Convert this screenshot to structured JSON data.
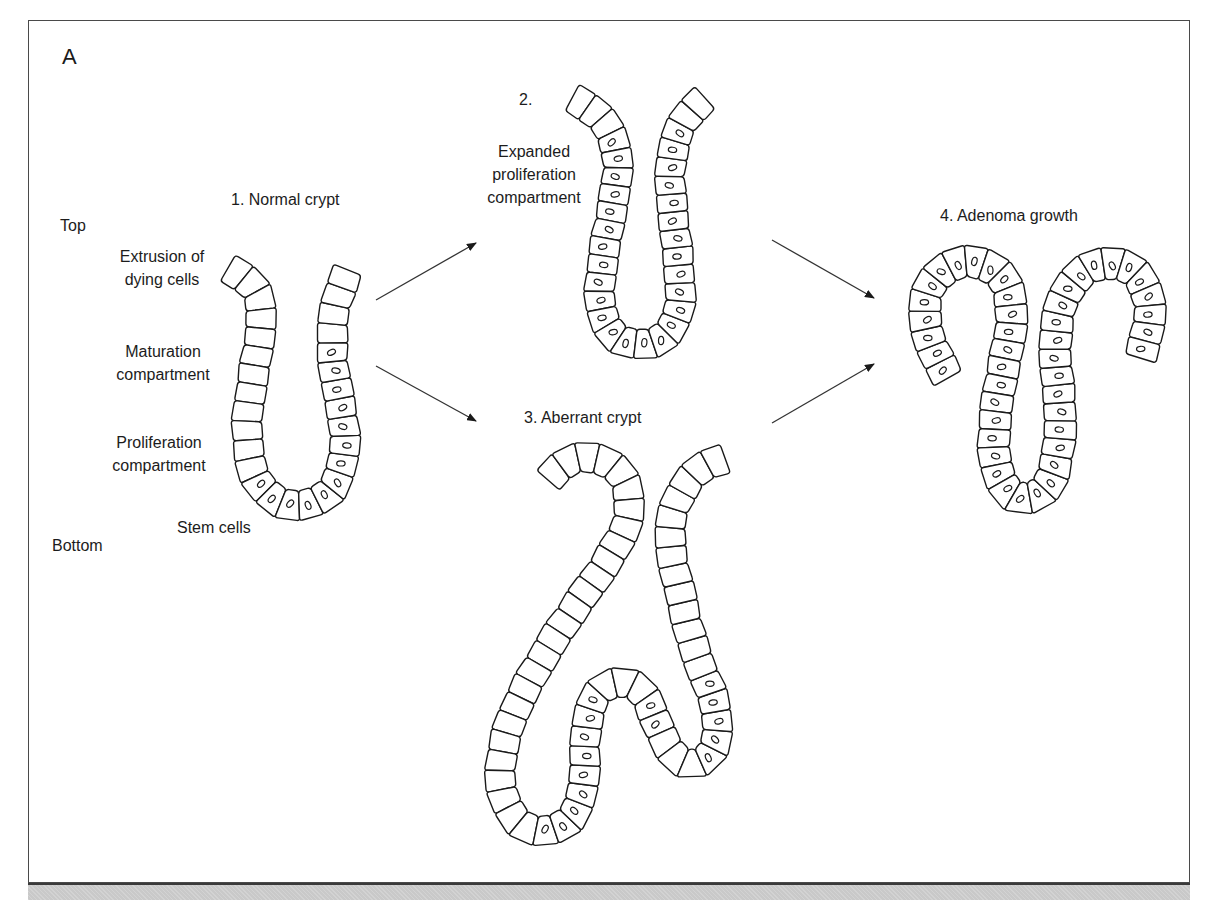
{
  "panel": {
    "letter": "A"
  },
  "axis_labels": {
    "top": "Top",
    "bottom": "Bottom"
  },
  "stages": [
    {
      "id": "normal",
      "title": "1. Normal crypt"
    },
    {
      "id": "expanded",
      "title": "2.",
      "subtitle_lines": [
        "Expanded",
        "proliferation",
        "compartment"
      ]
    },
    {
      "id": "aberrant",
      "title": "3. Aberrant crypt"
    },
    {
      "id": "adenoma",
      "title": "4. Adenoma growth"
    }
  ],
  "compartment_labels": [
    {
      "lines": [
        "Extrusion of",
        "dying cells"
      ]
    },
    {
      "lines": [
        "Maturation",
        "compartment"
      ]
    },
    {
      "lines": [
        "Proliferation",
        "compartment"
      ]
    },
    {
      "lines": [
        "Stem cells"
      ]
    }
  ],
  "arrows": [
    {
      "from": "normal",
      "to": "expanded",
      "x1": 376,
      "y1": 300,
      "x2": 476,
      "y2": 243
    },
    {
      "from": "normal",
      "to": "aberrant",
      "x1": 376,
      "y1": 366,
      "x2": 476,
      "y2": 421
    },
    {
      "from": "expanded",
      "to": "adenoma",
      "x1": 772,
      "y1": 240,
      "x2": 874,
      "y2": 298
    },
    {
      "from": "aberrant",
      "to": "adenoma",
      "x1": 772,
      "y1": 423,
      "x2": 874,
      "y2": 364
    }
  ],
  "crypts": [
    {
      "id": "normal",
      "width": 30,
      "cell_len": 19,
      "nuclei_from": 0.47,
      "nuclei_to": 1.0,
      "nuclei_start_only_right": false,
      "path": [
        [
          228,
          268
        ],
        [
          245,
          278
        ],
        [
          257,
          292
        ],
        [
          262,
          312
        ],
        [
          260,
          335
        ],
        [
          256,
          360
        ],
        [
          252,
          385
        ],
        [
          248,
          410
        ],
        [
          247,
          435
        ],
        [
          250,
          460
        ],
        [
          258,
          483
        ],
        [
          275,
          500
        ],
        [
          298,
          506
        ],
        [
          320,
          500
        ],
        [
          335,
          485
        ],
        [
          343,
          462
        ],
        [
          345,
          438
        ],
        [
          342,
          412
        ],
        [
          337,
          388
        ],
        [
          333,
          362
        ],
        [
          332,
          338
        ],
        [
          334,
          312
        ],
        [
          340,
          290
        ],
        [
          348,
          270
        ]
      ],
      "nuclei_ranges": [
        [
          0.42,
          0.86
        ]
      ]
    },
    {
      "id": "expanded",
      "width": 30,
      "cell_len": 18,
      "nuclei_ranges": [
        [
          0.1,
          0.93
        ]
      ],
      "path": [
        [
          572,
          98
        ],
        [
          590,
          108
        ],
        [
          604,
          122
        ],
        [
          614,
          140
        ],
        [
          618,
          162
        ],
        [
          616,
          185
        ],
        [
          612,
          210
        ],
        [
          607,
          235
        ],
        [
          603,
          260
        ],
        [
          600,
          285
        ],
        [
          600,
          305
        ],
        [
          606,
          325
        ],
        [
          620,
          340
        ],
        [
          640,
          345
        ],
        [
          660,
          340
        ],
        [
          674,
          325
        ],
        [
          680,
          305
        ],
        [
          680,
          282
        ],
        [
          678,
          258
        ],
        [
          675,
          232
        ],
        [
          672,
          205
        ],
        [
          670,
          180
        ],
        [
          672,
          155
        ],
        [
          678,
          132
        ],
        [
          690,
          112
        ],
        [
          705,
          98
        ]
      ]
    },
    {
      "id": "aberrant",
      "width": 30,
      "cell_len": 19,
      "nuclei_ranges": [
        [
          0.43,
          0.58
        ],
        [
          0.62,
          0.66
        ],
        [
          0.7,
          0.79
        ]
      ],
      "path": [
        [
          548,
          480
        ],
        [
          560,
          466
        ],
        [
          578,
          458
        ],
        [
          598,
          458
        ],
        [
          616,
          468
        ],
        [
          627,
          485
        ],
        [
          630,
          505
        ],
        [
          626,
          527
        ],
        [
          614,
          550
        ],
        [
          598,
          575
        ],
        [
          580,
          600
        ],
        [
          563,
          625
        ],
        [
          546,
          652
        ],
        [
          530,
          680
        ],
        [
          515,
          710
        ],
        [
          505,
          740
        ],
        [
          500,
          770
        ],
        [
          504,
          800
        ],
        [
          518,
          822
        ],
        [
          540,
          832
        ],
        [
          562,
          826
        ],
        [
          578,
          808
        ],
        [
          584,
          780
        ],
        [
          585,
          750
        ],
        [
          587,
          722
        ],
        [
          594,
          698
        ],
        [
          610,
          683
        ],
        [
          630,
          683
        ],
        [
          646,
          697
        ],
        [
          656,
          720
        ],
        [
          666,
          745
        ],
        [
          682,
          762
        ],
        [
          700,
          764
        ],
        [
          714,
          748
        ],
        [
          718,
          722
        ],
        [
          712,
          695
        ],
        [
          700,
          665
        ],
        [
          690,
          635
        ],
        [
          683,
          605
        ],
        [
          676,
          575
        ],
        [
          670,
          545
        ],
        [
          672,
          515
        ],
        [
          682,
          490
        ],
        [
          696,
          472
        ],
        [
          712,
          462
        ],
        [
          725,
          458
        ]
      ]
    },
    {
      "id": "adenoma",
      "width": 32,
      "cell_len": 18,
      "nuclei_ranges": [
        [
          0.0,
          1.0
        ]
      ],
      "path": [
        [
          948,
          378
        ],
        [
          938,
          360
        ],
        [
          929,
          338
        ],
        [
          924,
          314
        ],
        [
          928,
          290
        ],
        [
          940,
          272
        ],
        [
          958,
          263
        ],
        [
          978,
          262
        ],
        [
          996,
          270
        ],
        [
          1008,
          288
        ],
        [
          1012,
          310
        ],
        [
          1010,
          335
        ],
        [
          1005,
          360
        ],
        [
          1000,
          385
        ],
        [
          996,
          410
        ],
        [
          994,
          435
        ],
        [
          995,
          460
        ],
        [
          1002,
          484
        ],
        [
          1018,
          498
        ],
        [
          1036,
          497
        ],
        [
          1050,
          482
        ],
        [
          1057,
          458
        ],
        [
          1060,
          432
        ],
        [
          1060,
          405
        ],
        [
          1057,
          378
        ],
        [
          1055,
          350
        ],
        [
          1057,
          322
        ],
        [
          1064,
          296
        ],
        [
          1078,
          276
        ],
        [
          1098,
          264
        ],
        [
          1120,
          264
        ],
        [
          1138,
          275
        ],
        [
          1148,
          294
        ],
        [
          1150,
          316
        ],
        [
          1146,
          338
        ],
        [
          1140,
          358
        ]
      ]
    }
  ],
  "colors": {
    "ink": "#1a1a1a",
    "frame": "#4a4a4a",
    "caption_strip": "#c9c9c9",
    "cell_fill": "#ffffff"
  }
}
